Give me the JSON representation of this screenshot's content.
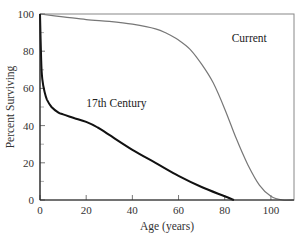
{
  "chart_data": {
    "type": "line",
    "title": "",
    "xlabel": "Age (years)",
    "ylabel": "Percent Surviving",
    "xlim": [
      0,
      110
    ],
    "ylim": [
      0,
      100
    ],
    "xticks": [
      0,
      20,
      40,
      60,
      80,
      100
    ],
    "yticks": [
      0,
      20,
      40,
      60,
      80,
      100
    ],
    "grid": false,
    "legend": "inline labels",
    "series": [
      {
        "name": "Current",
        "color": "#777777",
        "x": [
          0,
          10,
          20,
          30,
          40,
          50,
          55,
          60,
          65,
          70,
          75,
          80,
          85,
          90,
          95,
          100,
          105,
          110
        ],
        "y": [
          100,
          98.5,
          97,
          96,
          94.5,
          92,
          89.5,
          86,
          81,
          73,
          63,
          49,
          33,
          19,
          8,
          2,
          0,
          0
        ]
      },
      {
        "name": "17th Century",
        "color": "#111111",
        "x": [
          0,
          0.5,
          1,
          2,
          3,
          5,
          8,
          10,
          15,
          20,
          25,
          30,
          40,
          50,
          60,
          70,
          80,
          84
        ],
        "y": [
          100,
          75,
          65,
          58,
          54,
          50,
          47,
          46,
          44,
          42,
          39,
          35,
          27,
          20,
          13,
          7,
          2,
          0
        ]
      }
    ],
    "annotations": [
      {
        "text": "Current",
        "x": 83,
        "y": 85
      },
      {
        "text": "17th Century",
        "x": 20,
        "y": 50
      }
    ]
  }
}
